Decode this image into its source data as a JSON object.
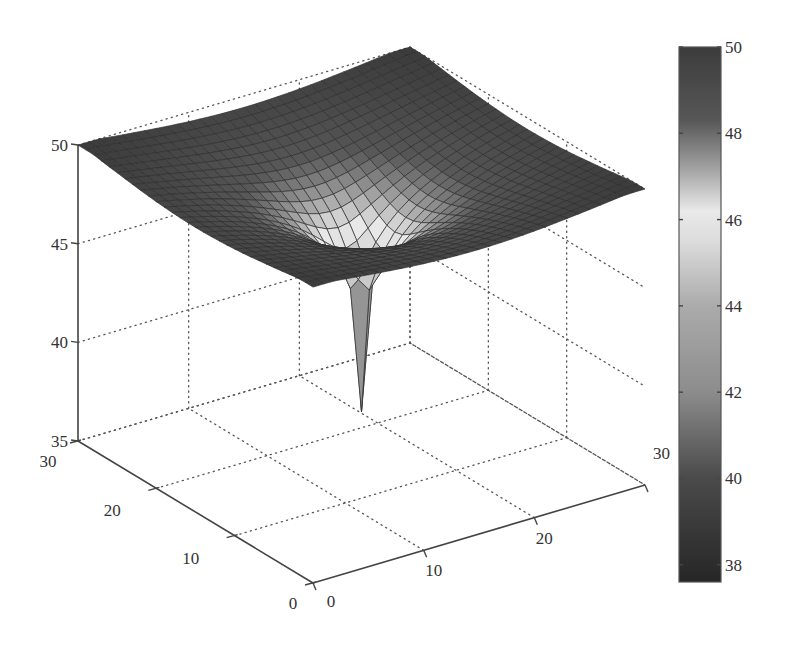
{
  "chart_data": {
    "type": "surface3d",
    "title": "",
    "xlabel": "",
    "ylabel": "",
    "zlabel": "",
    "x_range": [
      0,
      30
    ],
    "y_range": [
      0,
      30
    ],
    "z_range": [
      35,
      50
    ],
    "x_ticks": [
      0,
      10,
      20,
      30
    ],
    "y_ticks": [
      0,
      10,
      20,
      30
    ],
    "z_ticks": [
      35,
      40,
      45,
      50
    ],
    "grid": true,
    "grid_style": "dotted",
    "mesh_resolution": 1,
    "mesh_nodes": [
      31,
      31
    ],
    "well_location": {
      "x": 15,
      "y": 15
    },
    "model": {
      "form": "z = z_max - a*ln(R/r) for r < R; z = z_max for r >= R; z(well) = z_min",
      "z_max": 50.0,
      "a": 2.0,
      "R": 20.0,
      "z_min_at_well": 37.6
    },
    "profile_through_well": {
      "x": [
        0,
        1,
        2,
        3,
        4,
        5,
        6,
        7,
        8,
        9,
        10,
        11,
        12,
        13,
        14,
        15,
        16,
        17,
        18,
        19,
        20,
        21,
        22,
        23,
        24,
        25,
        26,
        27,
        28,
        29,
        30
      ],
      "z": [
        49.4,
        49.3,
        49.1,
        49.0,
        48.8,
        48.6,
        48.4,
        48.2,
        47.9,
        47.6,
        47.2,
        46.8,
        46.2,
        45.4,
        44.0,
        37.6,
        44.0,
        45.4,
        46.2,
        46.8,
        47.2,
        47.6,
        47.9,
        48.2,
        48.4,
        48.6,
        48.8,
        49.0,
        49.1,
        49.3,
        49.4
      ]
    },
    "colorbar": {
      "range": [
        37.6,
        50
      ],
      "ticks": [
        38,
        40,
        42,
        44,
        46,
        48,
        50
      ],
      "colormap_stops": [
        {
          "v": 37.6,
          "color": "#262626"
        },
        {
          "v": 40.0,
          "color": "#4a4a4a"
        },
        {
          "v": 42.0,
          "color": "#8c8c8c"
        },
        {
          "v": 44.0,
          "color": "#ababab"
        },
        {
          "v": 45.5,
          "color": "#dcdcdc"
        },
        {
          "v": 46.2,
          "color": "#e9e9e9"
        },
        {
          "v": 47.3,
          "color": "#9a9a9a"
        },
        {
          "v": 48.3,
          "color": "#575757"
        },
        {
          "v": 50.0,
          "color": "#3c3c3c"
        }
      ]
    }
  },
  "projection": {
    "origin_px": [
      313,
      583
    ],
    "x_unit_px": [
      11.067,
      -3.267
    ],
    "y_unit_px": [
      -7.833,
      -4.733
    ],
    "z_unit_px": -19.73,
    "z_base": 35
  },
  "colorbar_layout": {
    "left": 679,
    "top": 47,
    "width": 42,
    "height": 535
  }
}
